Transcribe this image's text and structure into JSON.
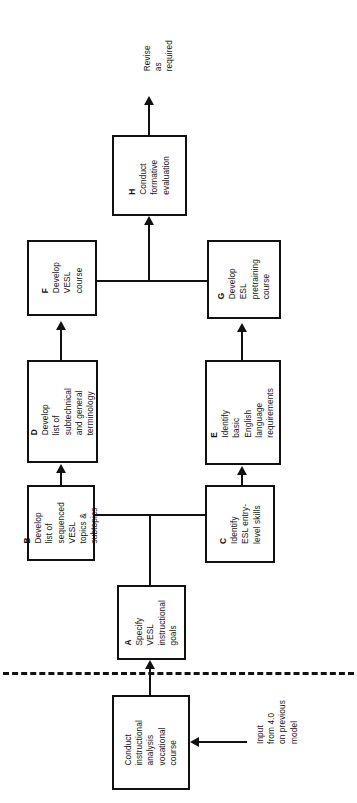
{
  "diagram": {
    "orientation": "rotated-90-ccw",
    "line_color": "#111111",
    "background": "#ffffff"
  },
  "nodes": {
    "input_source": {
      "label": "Input\nfrom 4.0\non previous\nmodel"
    },
    "prior": {
      "label": "Conduct\ninstructional\nanalysis\nvocational\ncourse"
    },
    "a": {
      "tag": "A",
      "label": "Specify\nVESL\ninstructional\ngoals"
    },
    "b": {
      "tag": "B",
      "label": "Develop\nlist of\nsequenced\nVESL\ntopics &\nsubtopics"
    },
    "c": {
      "tag": "C",
      "label": "Identify\nESL entry-\nlevel skills"
    },
    "d": {
      "tag": "D",
      "label": "Develop\nlist of\nsubtechnical\nand general\nterminology"
    },
    "e": {
      "tag": "E",
      "label": "Identify\nbasic\nEnglish\nlanguage\nrequirements"
    },
    "f": {
      "tag": "F",
      "label": "Develop\nVESL\ncourse"
    },
    "g": {
      "tag": "G",
      "label": "Develop\nESL\npretraining\ncourse"
    },
    "h": {
      "tag": "H",
      "label": "Conduct\nformative\nevaluation"
    },
    "output": {
      "label": "Revise\nas\nrequired"
    }
  },
  "edges": [
    {
      "from": "input_source",
      "to": "prior",
      "style": "solid-arrow"
    },
    {
      "from": "prior",
      "to": "a",
      "style": "solid-arrow",
      "crosses": "dashed-divider"
    },
    {
      "from": "a",
      "to": "b",
      "style": "solid-branch"
    },
    {
      "from": "a",
      "to": "c",
      "style": "solid-branch"
    },
    {
      "from": "b",
      "to": "d",
      "style": "solid-arrow"
    },
    {
      "from": "c",
      "to": "e",
      "style": "solid-arrow"
    },
    {
      "from": "d",
      "to": "f",
      "style": "solid-arrow"
    },
    {
      "from": "e",
      "to": "g",
      "style": "solid-arrow"
    },
    {
      "from": "f",
      "to": "h",
      "style": "solid-merge"
    },
    {
      "from": "g",
      "to": "h",
      "style": "solid-merge"
    },
    {
      "from": "h",
      "to": "output",
      "style": "solid-arrow"
    }
  ]
}
